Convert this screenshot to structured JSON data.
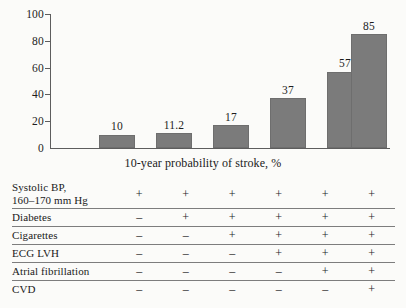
{
  "chart_data": {
    "type": "bar",
    "title": "",
    "xlabel": "10-year probability of stroke, %",
    "ylabel": "",
    "categories": [
      "1",
      "2",
      "3",
      "4",
      "5",
      "6"
    ],
    "values": [
      10,
      11.2,
      17,
      37,
      57,
      85
    ],
    "value_labels": [
      "10",
      "11.2",
      "17",
      "37",
      "57",
      "85"
    ],
    "ylim": [
      0,
      100
    ],
    "yticks": [
      0,
      20,
      40,
      60,
      80,
      100
    ],
    "ytick_labels": [
      "0",
      "20",
      "40",
      "60",
      "80",
      "100"
    ],
    "xticks": [],
    "grid": false,
    "legend": null,
    "bar_color": "#7b7b7b",
    "axis_color": "#5d5d5d"
  },
  "axis": {
    "y_labels": [
      "100",
      "80",
      "60",
      "40",
      "20",
      "0"
    ],
    "x_title": "10-year probability of stroke, %"
  },
  "risk_table": {
    "columns": 6,
    "rows": [
      {
        "label": "Systolic BP,\n160–170 mm Hg",
        "label_line1": "Systolic BP,",
        "label_line2": "160–170 mm Hg",
        "marks": [
          "+",
          "+",
          "+",
          "+",
          "+",
          "+"
        ]
      },
      {
        "label": "Diabetes",
        "marks": [
          "–",
          "+",
          "+",
          "+",
          "+",
          "+"
        ]
      },
      {
        "label": "Cigarettes",
        "marks": [
          "–",
          "–",
          "+",
          "+",
          "+",
          "+"
        ]
      },
      {
        "label": "ECG LVH",
        "marks": [
          "–",
          "–",
          "–",
          "+",
          "+",
          "+"
        ]
      },
      {
        "label": "Atrial fibrillation",
        "marks": [
          "–",
          "–",
          "–",
          "–",
          "+",
          "+"
        ]
      },
      {
        "label": "CVD",
        "marks": [
          "–",
          "–",
          "–",
          "–",
          "–",
          "+"
        ]
      }
    ]
  }
}
